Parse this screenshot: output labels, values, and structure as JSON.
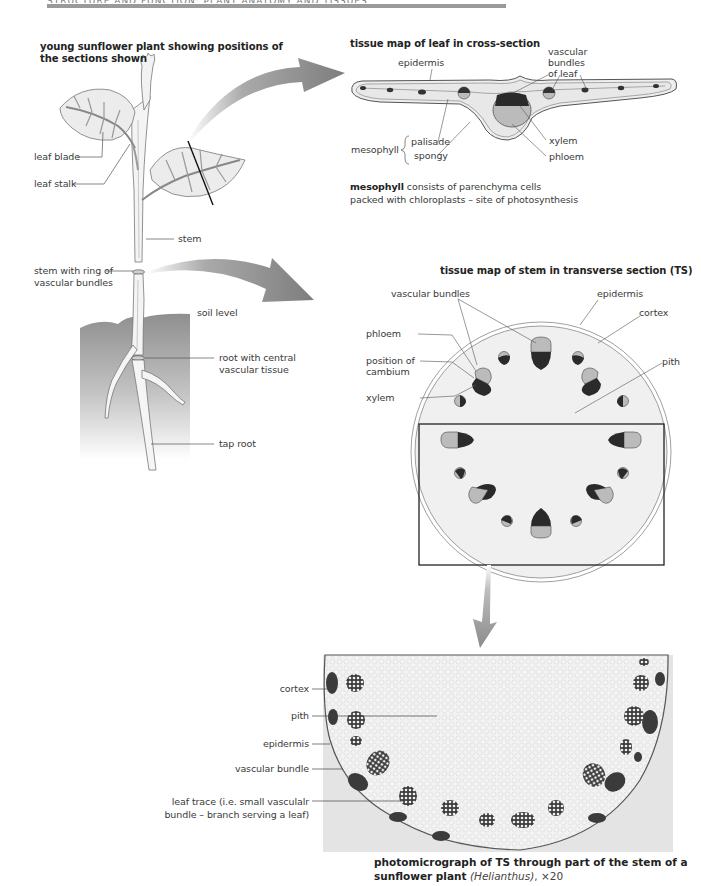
{
  "header": {
    "running_title": "STRUCTURE AND FUNCTION: PLANT ANATOMY AND TISSUES"
  },
  "plant": {
    "title_line1": "young sunflower plant showing positions of",
    "title_line2": "the sections shown",
    "labels": {
      "leaf_blade": "leaf blade",
      "leaf_stalk": "leaf stalk",
      "stem": "stem",
      "stem_ring_line1": "stem with ring of",
      "stem_ring_line2": "vascular bundles",
      "soil_level": "soil level",
      "root_line1": "root with central",
      "root_line2": "vascular tissue",
      "tap_root": "tap root"
    }
  },
  "leaf_section": {
    "title": "tissue map of leaf in cross-section",
    "labels": {
      "epidermis": "epidermis",
      "vascular_line1": "vascular",
      "vascular_line2": "bundles",
      "vascular_line3": "of leaf",
      "mesophyll": "mesophyll",
      "palisade": "palisade",
      "spongy": "spongy",
      "xylem": "xylem",
      "phloem": "phloem"
    },
    "note_bold": "mesophyll",
    "note_rest_line1": " consists of parenchyma cells",
    "note_line2": "packed with chloroplasts – site of photosynthesis"
  },
  "stem_section": {
    "title": "tissue map of stem in transverse section (TS)",
    "labels": {
      "vascular_bundles": "vascular bundles",
      "epidermis": "epidermis",
      "cortex": "cortex",
      "phloem": "phloem",
      "cambium_line1": "position of",
      "cambium_line2": "cambium",
      "pith": "pith",
      "xylem": "xylem"
    }
  },
  "photomicrograph": {
    "labels": {
      "cortex": "cortex",
      "pith": "pith",
      "epidermis": "epidermis",
      "vascular_bundle": "vascular bundle",
      "leaf_trace_line1": "leaf trace (i.e. small vasculalr",
      "leaf_trace_line2": "bundle – branch serving a leaf)"
    },
    "caption_bold_line1": "photomicrograph of TS through part of the stem of a",
    "caption_bold_line2": "sunflower plant",
    "caption_italic": "(Helianthus)",
    "caption_magnification": ", ×20"
  },
  "colors": {
    "arrow_gray": "#8a8a8a",
    "xylem_dark": "#2a2a2a",
    "phloem_light": "#b8b8b8",
    "tissue_fill": "#eeeeee",
    "soil_gray": "#9c9c9c"
  }
}
